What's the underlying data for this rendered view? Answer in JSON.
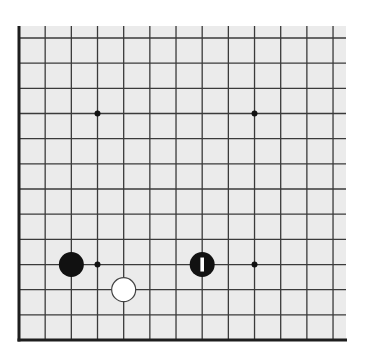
{
  "board": {
    "view": "partial-bottom-left-corner",
    "columns": 13,
    "rows": 13,
    "origin_x": 19,
    "origin_y": 38,
    "cell_w": 26.17,
    "cell_h": 25.17,
    "area": {
      "x": 19,
      "y": 26,
      "width": 327,
      "height": 315
    },
    "colors": {
      "background": "#ebebeb",
      "line": "#3a3a3a",
      "edge": "#1e1e1e",
      "black_stone": "#111111",
      "white_stone": "#ffffff",
      "white_stone_outline": "#444444",
      "marker": "#ffffff"
    },
    "edges": [
      "left",
      "bottom"
    ]
  },
  "star_points": [
    {
      "col": 3,
      "row": 3
    },
    {
      "col": 9,
      "row": 3
    },
    {
      "col": 3,
      "row": 9
    },
    {
      "col": 9,
      "row": 9
    }
  ],
  "stones": [
    {
      "color": "black",
      "col": 2,
      "row": 9,
      "marker": null
    },
    {
      "color": "black",
      "col": 7,
      "row": 9,
      "marker": "last-move-bar"
    },
    {
      "color": "white",
      "col": 4,
      "row": 10,
      "marker": null
    }
  ]
}
